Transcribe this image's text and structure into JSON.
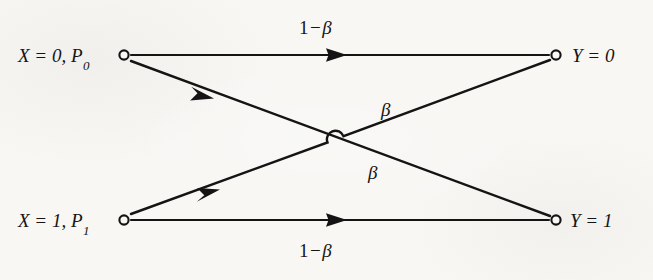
{
  "figure": {
    "kind": "binary-symmetric-channel-diagram",
    "background_color": "#f8f7f4",
    "ink_color": "#141414"
  },
  "nodes": [
    {
      "id": "x0",
      "side": "input",
      "label": "X = 0, P",
      "label_subscript": "0",
      "x": 124,
      "y": 55,
      "marker": "open-circle"
    },
    {
      "id": "x1",
      "side": "input",
      "label": "X = 1, P",
      "label_subscript": "1",
      "x": 124,
      "y": 220,
      "marker": "open-circle"
    },
    {
      "id": "y0",
      "side": "output",
      "label": "Y = 0",
      "label_subscript": "",
      "x": 556,
      "y": 55,
      "marker": "open-circle"
    },
    {
      "id": "y1",
      "side": "output",
      "label": "Y = 1",
      "label_subscript": "",
      "x": 556,
      "y": 220,
      "marker": "open-circle"
    }
  ],
  "edges": [
    {
      "id": "x0-y0",
      "from": "x0",
      "to": "y0",
      "label_lead": "1",
      "label_op": "−",
      "label_sym": "β",
      "label_full": "1 − β",
      "arrow_at": {
        "x": 340,
        "y": 55
      }
    },
    {
      "id": "x0-y1",
      "from": "x0",
      "to": "y1",
      "label_lead": "",
      "label_op": "",
      "label_sym": "β",
      "label_full": "β",
      "arrow_at": {
        "x": 207,
        "y": 96
      }
    },
    {
      "id": "x1-y0",
      "from": "x1",
      "to": "y0",
      "label_lead": "",
      "label_op": "",
      "label_sym": "β",
      "label_full": "β",
      "arrow_at": {
        "x": 212,
        "y": 193
      }
    },
    {
      "id": "x1-y1",
      "from": "x1",
      "to": "y1",
      "label_lead": "1",
      "label_op": "−",
      "label_sym": "β",
      "label_full": "1 − β",
      "arrow_at": {
        "x": 340,
        "y": 220
      }
    }
  ],
  "crossing": {
    "x": 335,
    "y": 137,
    "style": "line-hop",
    "hop_radius": 8
  }
}
